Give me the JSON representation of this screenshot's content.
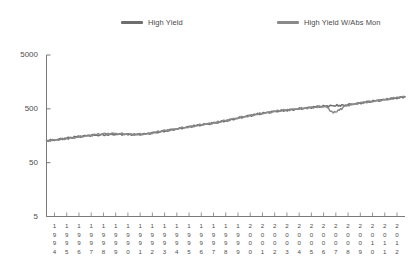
{
  "legend": {
    "position": "top",
    "items": [
      {
        "label": "High Yield",
        "color": "#6e6e6e",
        "name": "series-high-yield"
      },
      {
        "label": "High Yield W/Abs Mon",
        "color": "#8a8a8a",
        "name": "series-high-yield-abs-mon"
      }
    ]
  },
  "axes": {
    "y": {
      "scale": "log",
      "ticks": [
        5000,
        500,
        50,
        5
      ],
      "tick_labels": [
        "5000",
        "500",
        "50",
        "5"
      ],
      "range": [
        5,
        5000
      ],
      "label": ""
    },
    "x": {
      "label": "",
      "tick_labels": [
        "1994",
        "1995",
        "1996",
        "1997",
        "1998",
        "1999",
        "1990",
        "1991",
        "1992",
        "1993",
        "1994",
        "1995",
        "1996",
        "1997",
        "1998",
        "1999",
        "2000",
        "2001",
        "2002",
        "2003",
        "2004",
        "2005",
        "2006",
        "2007",
        "2008",
        "2009",
        "2010",
        "2011",
        "2012"
      ]
    }
  },
  "chart_data": {
    "type": "line",
    "title": "",
    "xlabel": "",
    "ylabel": "",
    "yscale": "log",
    "ylim": [
      5,
      5000
    ],
    "grid": false,
    "legend_position": "top",
    "x": [
      1994.0,
      1994.5,
      1995.0,
      1995.5,
      1996.0,
      1996.5,
      1997.0,
      1997.5,
      1998.0,
      1998.5,
      1999.0,
      1999.5,
      2000.0,
      2000.5,
      2001.0,
      2001.5,
      2002.0,
      2002.5,
      2003.0,
      2003.5,
      2004.0,
      2004.5,
      2005.0,
      2005.5,
      2006.0,
      2006.5,
      2007.0,
      2007.5,
      2008.0,
      2008.4,
      2008.7,
      2009.0,
      2009.5,
      2010.0,
      2010.5,
      2011.0,
      2011.5,
      2012.0
    ],
    "series": [
      {
        "name": "High Yield",
        "color": "#6e6e6e",
        "values": [
          128,
          134,
          142,
          150,
          158,
          163,
          166,
          168,
          168,
          166,
          170,
          182,
          196,
          210,
          226,
          242,
          258,
          276,
          300,
          330,
          360,
          392,
          420,
          448,
          470,
          492,
          516,
          540,
          560,
          572,
          580,
          588,
          620,
          660,
          700,
          740,
          790,
          840
        ]
      },
      {
        "name": "High Yield W/Abs Mon",
        "color": "#8a8a8a",
        "values": [
          128,
          133,
          140,
          149,
          157,
          166,
          172,
          174,
          170,
          166,
          171,
          184,
          198,
          212,
          228,
          244,
          260,
          278,
          302,
          332,
          362,
          394,
          422,
          450,
          472,
          494,
          518,
          542,
          556,
          420,
          470,
          566,
          622,
          662,
          702,
          742,
          792,
          842
        ]
      }
    ]
  }
}
